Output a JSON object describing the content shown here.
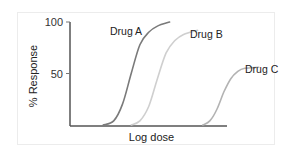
{
  "chart_data": {
    "type": "line",
    "title": "",
    "xlabel": "Log dose",
    "ylabel": "% Response",
    "ylim": [
      0,
      100
    ],
    "xlim": [
      0,
      10
    ],
    "yticks": [
      {
        "value": 100,
        "label": "100"
      },
      {
        "value": 50,
        "label": "50"
      }
    ],
    "grid": false,
    "legend": "inline labels",
    "series": [
      {
        "name": "Drug A",
        "color": "#7a7a7a",
        "x": [
          1.9,
          2.5,
          3.0,
          3.5,
          4.0,
          4.5,
          5.0,
          5.7
        ],
        "y": [
          0,
          4,
          20,
          50,
          78,
          90,
          96,
          100
        ]
      },
      {
        "name": "Drug B",
        "color": "#cfcfcf",
        "x": [
          3.5,
          4.0,
          4.5,
          5.0,
          5.5,
          6.0,
          6.5,
          7.3
        ],
        "y": [
          0,
          4,
          18,
          45,
          70,
          82,
          88,
          92
        ]
      },
      {
        "name": "Drug C",
        "color": "#b3b3b3",
        "x": [
          7.6,
          8.0,
          8.4,
          8.8,
          9.2,
          9.6,
          10.0,
          10.8
        ],
        "y": [
          0,
          4,
          15,
          32,
          45,
          52,
          55,
          56
        ]
      }
    ]
  }
}
